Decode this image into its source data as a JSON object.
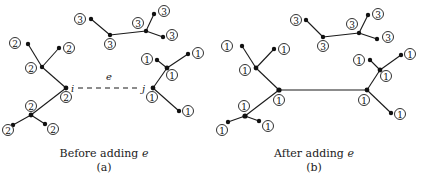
{
  "panels": [
    {
      "id": "a",
      "caption": "Before adding e",
      "sublabel": "(a)",
      "edge_label": "e",
      "endpoint_i": "i",
      "endpoint_j": "j",
      "dashed_edge": true
    },
    {
      "id": "b",
      "caption": "After adding e",
      "sublabel": "(b)",
      "dashed_edge": false
    }
  ],
  "labels": {
    "tree_top": "3",
    "tree_left_before": "2",
    "tree_right": "1",
    "merged": "1"
  }
}
